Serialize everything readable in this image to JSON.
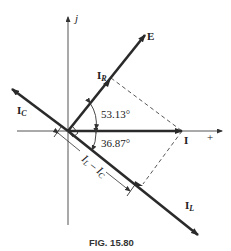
{
  "figure": {
    "caption": "FIG. 15.80"
  },
  "axes": {
    "imag_label": "j",
    "real_label": "+"
  },
  "phasors": {
    "E": {
      "label": "E",
      "angle_deg": 53.13
    },
    "IR": {
      "label": "I",
      "sub": "R",
      "angle_deg": 53.13
    },
    "I": {
      "label": "I",
      "angle_deg": 0
    },
    "IC": {
      "label": "I",
      "sub": "C",
      "angle_deg": 143.13
    },
    "IL": {
      "label": "I",
      "sub": "L",
      "angle_deg": -36.87
    }
  },
  "angles": {
    "upper": "53.13°",
    "lower": "36.87°"
  },
  "dimension": {
    "part1": "I",
    "sub1": "L",
    "minus": " – ",
    "part2": "I",
    "sub2": "C"
  },
  "colors": {
    "line": "#2a2a2a",
    "axis": "#555555"
  }
}
